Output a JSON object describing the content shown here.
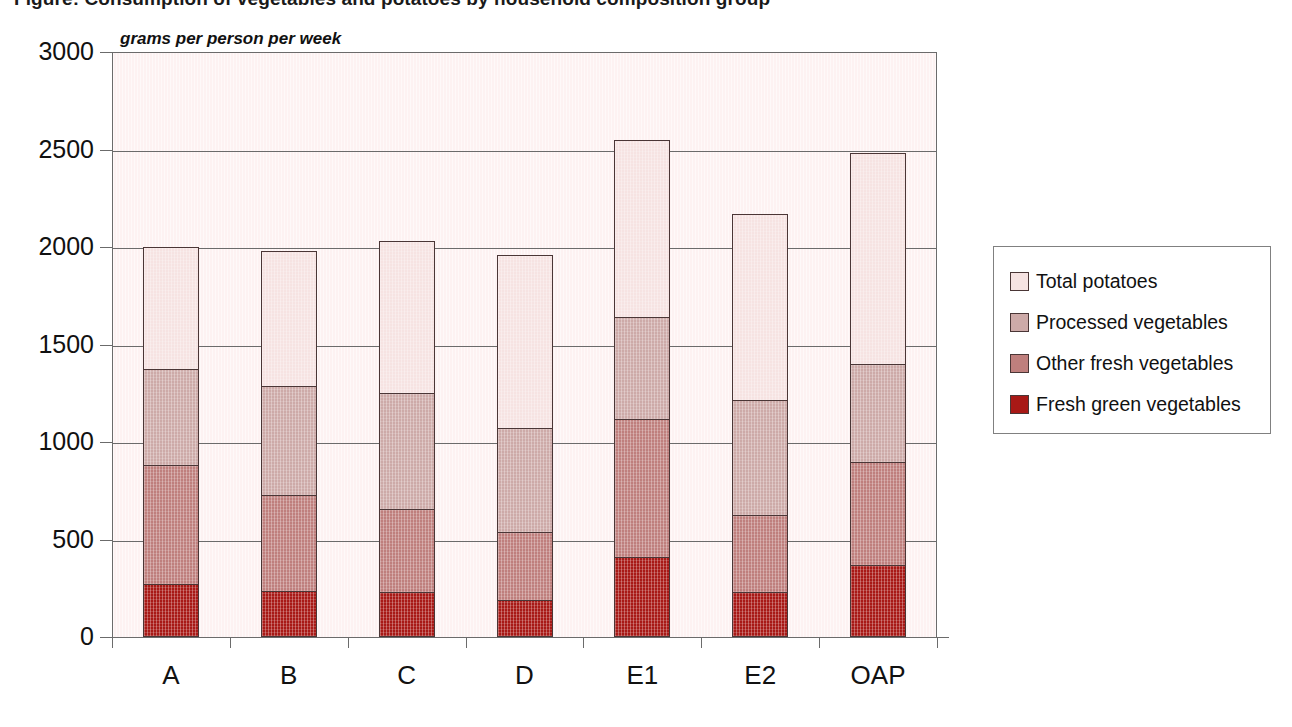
{
  "chart_title": "Figure: Consumption of vegetables and potatoes by household composition group",
  "units_label": "grams per person per week",
  "legend": {
    "items": [
      {
        "label": "Total potatoes",
        "color": "#f6e3e2"
      },
      {
        "label": "Processed vegetables",
        "color": "#cdaaa8"
      },
      {
        "label": "Other fresh vegetables",
        "color": "#bf7f7d"
      },
      {
        "label": "Fresh green vegetables",
        "color": "#a81916"
      }
    ]
  },
  "axis": {
    "y_ticks": [
      "3000",
      "2500",
      "2000",
      "1500",
      "1000",
      "500",
      "0"
    ],
    "y_min": 0,
    "y_max": 3000,
    "y_step": 500,
    "x_categories": [
      "A",
      "B",
      "C",
      "D",
      "E1",
      "E2",
      "OAP"
    ]
  },
  "chart_data": {
    "type": "bar",
    "stacked": true,
    "title": "Figure: Consumption of vegetables and potatoes by household composition group",
    "xlabel": "",
    "ylabel": "grams per person per week",
    "ylim": [
      0,
      3000
    ],
    "ystep": 500,
    "grid": true,
    "legend_position": "right",
    "categories": [
      "A",
      "B",
      "C",
      "D",
      "E1",
      "E2",
      "OAP"
    ],
    "series": [
      {
        "name": "Fresh green vegetables",
        "color": "#a81916",
        "values": [
          270,
          235,
          230,
          190,
          410,
          230,
          370
        ]
      },
      {
        "name": "Other fresh vegetables",
        "color": "#bf7f7d",
        "values": [
          610,
          495,
          425,
          350,
          710,
          395,
          530
        ]
      },
      {
        "name": "Processed vegetables",
        "color": "#cdaaa8",
        "values": [
          495,
          555,
          595,
          530,
          520,
          590,
          500
        ]
      },
      {
        "name": "Total potatoes",
        "color": "#f6e3e2",
        "values": [
          625,
          695,
          780,
          890,
          910,
          955,
          1080
        ]
      }
    ],
    "cumulative_tops": [
      {
        "category": "A",
        "green": 270,
        "other": 880,
        "processed": 1375,
        "total": 2000
      },
      {
        "category": "B",
        "green": 235,
        "other": 730,
        "processed": 1285,
        "total": 1980
      },
      {
        "category": "C",
        "green": 230,
        "other": 655,
        "processed": 1250,
        "total": 2030
      },
      {
        "category": "D",
        "green": 190,
        "other": 540,
        "processed": 1070,
        "total": 1960
      },
      {
        "category": "E1",
        "green": 410,
        "other": 1120,
        "processed": 1640,
        "total": 2550
      },
      {
        "category": "E2",
        "green": 230,
        "other": 625,
        "processed": 1215,
        "total": 2170
      },
      {
        "category": "OAP",
        "green": 370,
        "other": 900,
        "processed": 1400,
        "total": 2480
      }
    ]
  }
}
